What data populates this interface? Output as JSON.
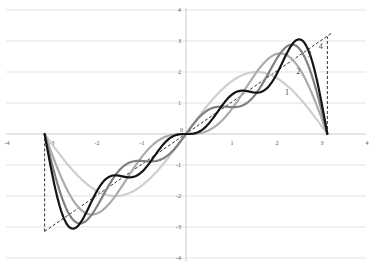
{
  "chart_data": {
    "type": "line",
    "title": "",
    "xlabel": "",
    "ylabel": "",
    "xlim": [
      -4,
      4
    ],
    "ylim": [
      -4,
      4
    ],
    "grid": {
      "horizontal": true,
      "vertical": false
    },
    "legend": "inline labels near right peak",
    "x_ticks": [
      "-4",
      "-3",
      "-2",
      "-1",
      "0",
      "1",
      "2",
      "3",
      "4"
    ],
    "y_ticks": [
      "-4",
      "-3",
      "-2",
      "-1",
      "0",
      "1",
      "2",
      "3",
      "4"
    ],
    "x_domain": [
      -3.14159,
      3.14159
    ],
    "series": [
      {
        "name": "1",
        "terms": 1,
        "color": "#cfcfcf",
        "width": 2.2
      },
      {
        "name": "2",
        "terms": 2,
        "color": "#ababab",
        "width": 2.2
      },
      {
        "name": "3",
        "terms": 3,
        "color": "#808080",
        "width": 2.2
      },
      {
        "name": "4",
        "terms": 4,
        "color": "#141414",
        "width": 2.2
      }
    ],
    "reference": {
      "name": "f(x)=x",
      "style": "dashed",
      "color": "#333333",
      "points": [
        [
          -3.14159,
          -3.14159
        ],
        [
          3.14159,
          3.14159
        ]
      ],
      "vertical_segments": [
        {
          "x": -3.14159,
          "y_from": -3.14159,
          "y_to": 0
        },
        {
          "x": 3.14159,
          "y_from": 0,
          "y_to": 3.14159
        }
      ]
    },
    "series_labels": [
      {
        "text": "1",
        "x": 2.2,
        "y": 1.25
      },
      {
        "text": "2",
        "x": 2.45,
        "y": 1.95
      },
      {
        "text": "3",
        "x": 2.7,
        "y": 2.5
      },
      {
        "text": "4",
        "x": 2.95,
        "y": 2.75
      }
    ]
  },
  "layout": {
    "origin_px": [
      186,
      134
    ],
    "px_per_unit_x": 45,
    "px_per_unit_y": 31
  }
}
